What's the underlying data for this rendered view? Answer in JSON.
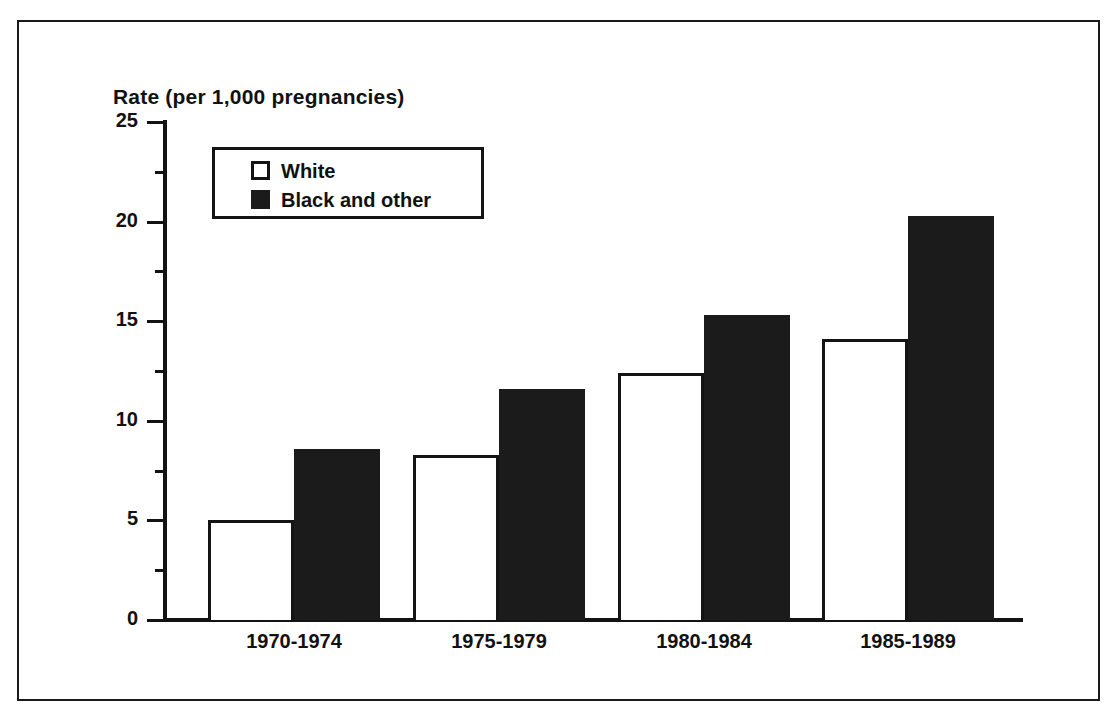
{
  "chart_data": {
    "type": "bar",
    "title": "Rate (per 1,000 pregnancies)",
    "xlabel": "",
    "ylabel": "Rate (per 1,000 pregnancies)",
    "categories": [
      "1970-1974",
      "1975-1979",
      "1980-1984",
      "1985-1989"
    ],
    "series": [
      {
        "name": "White",
        "values": [
          5.0,
          8.3,
          12.4,
          14.1
        ],
        "color": "#ffffff"
      },
      {
        "name": "Black and other",
        "values": [
          8.6,
          11.6,
          15.3,
          20.3
        ],
        "color": "#1b1b1b"
      }
    ],
    "ylim": [
      0,
      25
    ],
    "y_ticks": [
      "0",
      "5",
      "10",
      "15",
      "20",
      "25"
    ],
    "y_tick_values": [
      0,
      5,
      10,
      15,
      20,
      25
    ],
    "y_minor_tick_values": [
      2.5,
      7.5,
      12.5,
      17.5,
      22.5
    ],
    "grid": false,
    "legend_position": "top-left"
  },
  "legend": {
    "entries": [
      {
        "label": "White",
        "swatch": "white-square-outline"
      },
      {
        "label": "Black and other",
        "swatch": "black-filled-square"
      }
    ]
  }
}
